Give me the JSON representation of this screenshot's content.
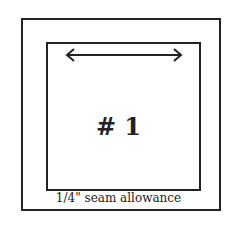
{
  "diagram": {
    "piece_label": "# 1",
    "caption": "1/4\" seam allowance",
    "arrow": "double-headed grainline arrow",
    "colors": {
      "line": "#222222",
      "background": "#ffffff"
    }
  }
}
